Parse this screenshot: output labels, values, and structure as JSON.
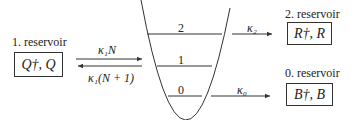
{
  "reservoirs": {
    "left": {
      "label": "1. reservoir",
      "operators": "Q†, Q"
    },
    "top_right": {
      "label": "2. reservoir",
      "operators": "R†, R"
    },
    "bottom_right": {
      "label": "0. reservoir",
      "operators": "B†, B"
    }
  },
  "levels": [
    "0",
    "1",
    "2"
  ],
  "rates": {
    "pump_in": "κ₁N",
    "pump_out": "κ₁(N + 1)",
    "level2_out": "κ₂",
    "level0_out": "κ₀"
  }
}
